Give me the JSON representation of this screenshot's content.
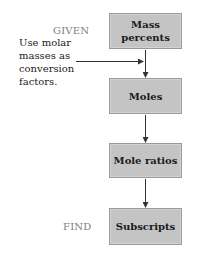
{
  "diagram": {
    "steps": [
      {
        "label_line1": "Mass",
        "label_line2": "percents"
      },
      {
        "label": "Moles"
      },
      {
        "label": "Mole ratios"
      },
      {
        "label": "Subscripts"
      }
    ],
    "given_label": "GIVEN",
    "find_label": "FIND",
    "note": "Use molar masses as conversion factors."
  },
  "colors": {
    "box_fill": "#c4c4c4",
    "box_border": "#9a9a9a",
    "side_label": "#808080",
    "arrow": "#333333"
  }
}
